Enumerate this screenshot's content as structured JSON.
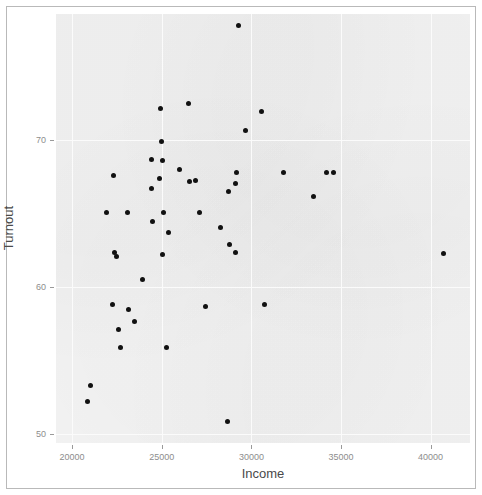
{
  "chart_data": {
    "type": "scatter",
    "title": "",
    "xlabel": "Income",
    "ylabel": "Turnout",
    "xlim": [
      19100,
      42200
    ],
    "ylim": [
      49.4,
      78.6
    ],
    "xticks": [
      20000,
      25000,
      30000,
      35000,
      40000
    ],
    "xticklabels": [
      "20000",
      "25000",
      "30000",
      "35000",
      "40000"
    ],
    "yticks": [
      50,
      60,
      70
    ],
    "yticklabels": [
      "50",
      "60",
      "70"
    ],
    "grid": true,
    "grid_color": "#fbfbfb",
    "panel_background": "#f2f2f2",
    "point_color": "#111111",
    "point_size": 5,
    "legend": null,
    "n_points": 48,
    "points": [
      {
        "x": 29270,
        "y": 77.8
      },
      {
        "x": 24920,
        "y": 72.2
      },
      {
        "x": 26490,
        "y": 72.5
      },
      {
        "x": 30580,
        "y": 72.0
      },
      {
        "x": 29660,
        "y": 70.7
      },
      {
        "x": 25000,
        "y": 69.9
      },
      {
        "x": 24450,
        "y": 68.7
      },
      {
        "x": 25060,
        "y": 68.6
      },
      {
        "x": 26000,
        "y": 68.0
      },
      {
        "x": 29150,
        "y": 67.8
      },
      {
        "x": 31780,
        "y": 67.8
      },
      {
        "x": 34180,
        "y": 67.8
      },
      {
        "x": 34570,
        "y": 67.8
      },
      {
        "x": 22300,
        "y": 67.6
      },
      {
        "x": 24900,
        "y": 67.4
      },
      {
        "x": 26900,
        "y": 67.3
      },
      {
        "x": 26560,
        "y": 67.2
      },
      {
        "x": 29090,
        "y": 67.1
      },
      {
        "x": 28700,
        "y": 66.5
      },
      {
        "x": 24400,
        "y": 66.7
      },
      {
        "x": 33450,
        "y": 66.2
      },
      {
        "x": 21900,
        "y": 65.1
      },
      {
        "x": 23070,
        "y": 65.1
      },
      {
        "x": 25080,
        "y": 65.1
      },
      {
        "x": 27100,
        "y": 65.1
      },
      {
        "x": 24500,
        "y": 64.5
      },
      {
        "x": 28300,
        "y": 64.1
      },
      {
        "x": 25400,
        "y": 63.7
      },
      {
        "x": 28760,
        "y": 62.9
      },
      {
        "x": 22350,
        "y": 62.4
      },
      {
        "x": 22460,
        "y": 62.1
      },
      {
        "x": 25060,
        "y": 62.2
      },
      {
        "x": 29110,
        "y": 62.4
      },
      {
        "x": 40740,
        "y": 62.3
      },
      {
        "x": 23910,
        "y": 60.5
      },
      {
        "x": 22250,
        "y": 58.8
      },
      {
        "x": 23140,
        "y": 58.5
      },
      {
        "x": 27450,
        "y": 58.7
      },
      {
        "x": 30740,
        "y": 58.8
      },
      {
        "x": 23460,
        "y": 57.7
      },
      {
        "x": 22600,
        "y": 57.1
      },
      {
        "x": 22700,
        "y": 55.9
      },
      {
        "x": 25270,
        "y": 55.9
      },
      {
        "x": 21000,
        "y": 53.3
      },
      {
        "x": 20850,
        "y": 52.2
      },
      {
        "x": 28690,
        "y": 50.9
      }
    ]
  },
  "axes": {
    "x": {
      "label": "Income",
      "ticks": [
        {
          "value": 20000,
          "label": "20000"
        },
        {
          "value": 25000,
          "label": "25000"
        },
        {
          "value": 30000,
          "label": "30000"
        },
        {
          "value": 35000,
          "label": "35000"
        },
        {
          "value": 40000,
          "label": "40000"
        }
      ]
    },
    "y": {
      "label": "Turnout",
      "ticks": [
        {
          "value": 70,
          "label": "70"
        },
        {
          "value": 60,
          "label": "60"
        },
        {
          "value": 50,
          "label": "50"
        }
      ]
    }
  },
  "style": {
    "panel_fill": "#f2f2f2",
    "grid_color": "#fbfbfb",
    "point_color": "#111111",
    "tick_text_color": "#8d8d8d",
    "axis_title_color": "#4a4a4a",
    "frame_border_color": "#b9b9b9"
  }
}
